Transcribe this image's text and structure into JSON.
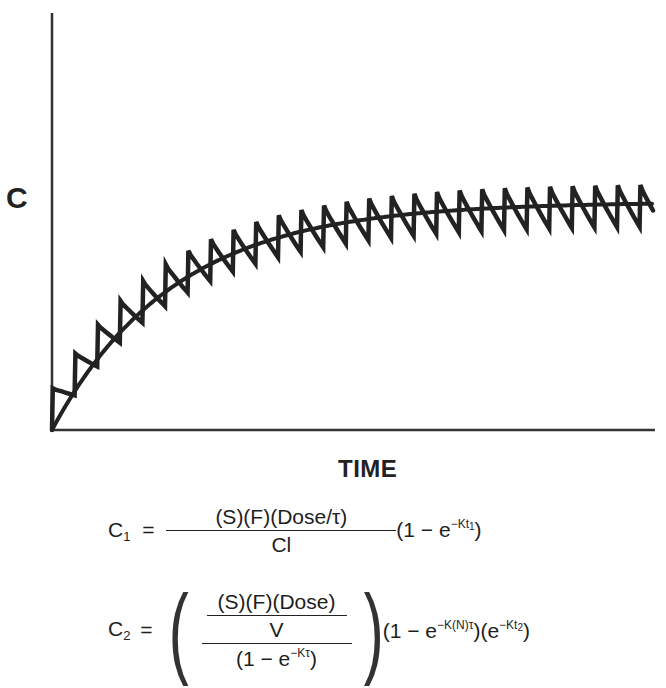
{
  "chart_data": {
    "type": "line",
    "title": "",
    "xlabel": "TIME",
    "ylabel": "C",
    "grid": false,
    "legend": null,
    "series": [
      {
        "name": "Intermittent dosing (sawtooth)",
        "dose_interval_px": 22.6,
        "n_doses": 27,
        "relative_peak_plateau": 1.0,
        "relative_trough_plateau": 0.83
      },
      {
        "name": "Continuous infusion (smooth)",
        "shape": "1 - e^(-Kt)",
        "relative_plateau": 0.91
      }
    ],
    "x": [
      0,
      1,
      2,
      3,
      4,
      5,
      6,
      7,
      8,
      9,
      10
    ],
    "smooth_values": [
      0.0,
      0.17,
      0.31,
      0.43,
      0.53,
      0.61,
      0.68,
      0.74,
      0.78,
      0.82,
      0.85
    ],
    "xlim": [
      0,
      10
    ],
    "ylim": [
      0,
      1.2
    ]
  },
  "plot": {
    "origin_x": 52,
    "origin_y": 430,
    "x_end": 655,
    "y_top": 13,
    "plateau_px": 228,
    "k_per_px": 0.0082,
    "first_dose_x": 52,
    "dose_interval_px": 22.6,
    "sawtooth_amplitude_px": 34,
    "stroke_color": "#222222"
  },
  "labels": {
    "y_axis": "C",
    "x_axis": "TIME"
  },
  "equations": {
    "eq1": {
      "lhs": "C",
      "lhs_sub": "1",
      "equals": "=",
      "numerator": "(S)(F)(Dose/τ)",
      "denominator": "Cl",
      "tail_open": "(1 − e",
      "tail_sup": "−Kt",
      "tail_sup_sub": "1",
      "tail_close": ")"
    },
    "eq2": {
      "lhs": "C",
      "lhs_sub": "2",
      "equals": "=",
      "inner_numerator": "(S)(F)(Dose)",
      "inner_denominator": "V",
      "outer_denominator_open": "(1 − e",
      "outer_denominator_sup": "−Kτ",
      "outer_denominator_close": ")",
      "paren_left": "(",
      "paren_right": ")",
      "tail1_open": "(1 − e",
      "tail1_sup": "−K(N)τ",
      "tail1_close": ")",
      "tail2_open": "(e",
      "tail2_sup": "−Kt",
      "tail2_sup_sub": "2",
      "tail2_close": ")"
    }
  }
}
